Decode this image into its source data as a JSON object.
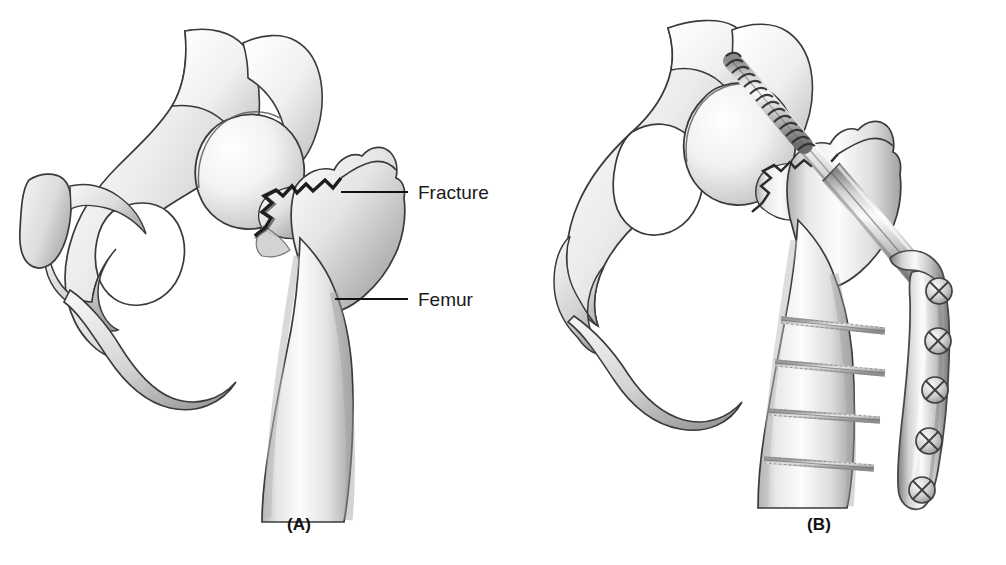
{
  "figure": {
    "domain": "medical-illustration",
    "background_color": "#ffffff",
    "ink_color": "#1a1a1a",
    "bone_fill_light": "#fbfbfb",
    "bone_fill_mid": "#d9d9d9",
    "bone_fill_dark": "#9a9a9a",
    "metal_light": "#e8e8e8",
    "metal_mid": "#b4b4b4",
    "metal_dark": "#6d6d6d"
  },
  "panels": [
    {
      "id": "A",
      "caption": "(A)",
      "description": "Fractured proximal femur and hemipelvis, anterior view",
      "labels": [
        {
          "id": "fracture",
          "text": "Fracture",
          "text_x": 418,
          "text_y": 199,
          "leader_x1": 341,
          "leader_y1": 192,
          "leader_x2": 408,
          "leader_y2": 192
        },
        {
          "id": "femur",
          "text": "Femur",
          "text_x": 418,
          "text_y": 306,
          "leader_x1": 335,
          "leader_y1": 299,
          "leader_x2": 408,
          "leader_y2": 299
        }
      ],
      "structures": [
        "ilium",
        "acetabulum",
        "obturator-foramen",
        "pubic-symphysis-stub",
        "ischium",
        "femoral-head",
        "femoral-neck",
        "greater-trochanter",
        "lesser-trochanter",
        "femoral-shaft",
        "fracture-line"
      ]
    },
    {
      "id": "B",
      "caption": "(B)",
      "description": "Same fracture fixed with a dynamic hip screw and side plate",
      "labels": [],
      "structures": [
        "ilium",
        "acetabulum",
        "obturator-foramen",
        "femoral-head",
        "femoral-neck",
        "greater-trochanter",
        "femoral-shaft",
        "fracture-line"
      ],
      "hardware": {
        "name": "dynamic-hip-screw",
        "lag_screw": {
          "thread_turns": 13,
          "angle_deg": 41
        },
        "barrel": {
          "present": true
        },
        "side_plate": {
          "present": true,
          "screw_head_count": 5
        },
        "cortical_screws": {
          "count": 4
        }
      }
    }
  ],
  "footer": {
    "cropped_caption_visible": false,
    "cropped_caption_text": ""
  }
}
